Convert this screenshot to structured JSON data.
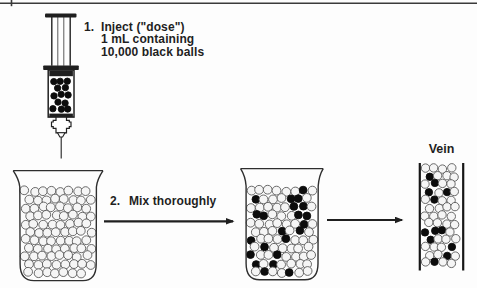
{
  "colors": {
    "ink": "#1f1f1f",
    "paper": "#fdfdfd",
    "ball_outline": "#5a5a5a",
    "ball_fill": "#f5f5f5",
    "black_ball": "#0c0c0c"
  },
  "step1": {
    "number": "1.",
    "line1": "Inject (\"dose\")",
    "line2": "1 mL containing",
    "line3": "10,000 black balls"
  },
  "step2": {
    "number": "2.",
    "label": "Mix thoroughly"
  },
  "vein": {
    "label": "Vein",
    "black_ball_count": 12
  },
  "syringe": {
    "black_ball_count": 13
  },
  "left_beaker": {
    "black_ball_count": 0
  },
  "middle_beaker": {
    "black_ball_count": 22
  }
}
